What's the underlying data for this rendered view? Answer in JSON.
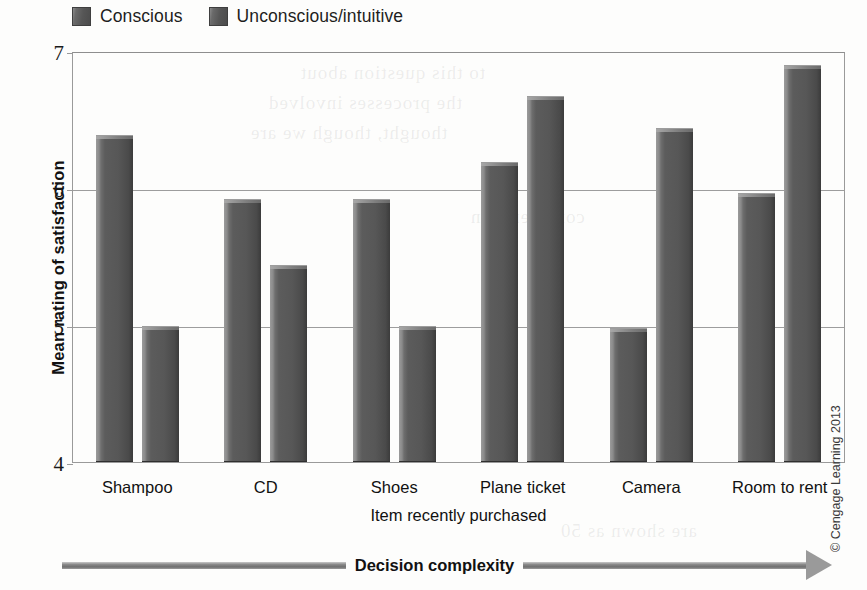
{
  "legend": {
    "entries": [
      {
        "label": "Conscious",
        "color": "#565656"
      },
      {
        "label": "Unconscious/intuitive",
        "color": "#565656"
      }
    ]
  },
  "axis": {
    "y_title": "Mean rating of satisfaction",
    "x_title": "Item recently purchased",
    "y_ticks": [
      "7",
      "6",
      "5",
      "4"
    ]
  },
  "complexity": {
    "label": "Decision complexity"
  },
  "credit": {
    "text": "© Cengage Learning 2013"
  },
  "chart_data": {
    "type": "bar",
    "title": "",
    "xlabel": "Item recently purchased",
    "ylabel": "Mean rating of satisfaction",
    "ylim": [
      4,
      7
    ],
    "yticks": [
      4,
      5,
      6,
      7
    ],
    "grid": true,
    "legend_position": "top-left",
    "categories": [
      "Shampoo",
      "CD",
      "Shoes",
      "Plane ticket",
      "Camera",
      "Room to rent"
    ],
    "series": [
      {
        "name": "Conscious",
        "values": [
          6.39,
          5.92,
          5.92,
          6.19,
          4.98,
          5.96
        ]
      },
      {
        "name": "Unconscious/intuitive",
        "values": [
          4.99,
          5.44,
          4.99,
          6.67,
          6.44,
          6.9
        ]
      }
    ],
    "annotations": [
      "Decision complexity"
    ]
  },
  "bleed_text": [
    {
      "text": "to this question about",
      "x": 300,
      "y": 62
    },
    {
      "text": "the processes involved",
      "x": 268,
      "y": 92
    },
    {
      "text": "thought, though we are",
      "x": 250,
      "y": 122
    },
    {
      "text": "considered in",
      "x": 470,
      "y": 206
    },
    {
      "text": "are shown as 50",
      "x": 560,
      "y": 520
    }
  ]
}
